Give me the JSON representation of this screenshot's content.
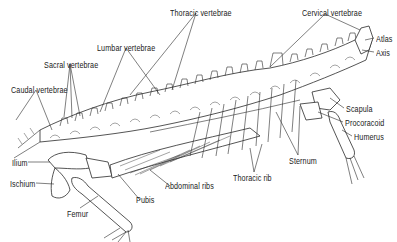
{
  "figure": {
    "labels": [
      {
        "id": "thoracic-vertebrae",
        "text": "Thoracic vertebrae",
        "x": 170,
        "y": 9
      },
      {
        "id": "cervical-vertebrae",
        "text": "Cervical vertebrae",
        "x": 302,
        "y": 9
      },
      {
        "id": "atlas",
        "text": "Atlas",
        "x": 376,
        "y": 35
      },
      {
        "id": "axis",
        "text": "Axis",
        "x": 376,
        "y": 49
      },
      {
        "id": "lumbar-vertebrae",
        "text": "Lumbar vertebrae",
        "x": 97,
        "y": 44
      },
      {
        "id": "sacral-vertebrae",
        "text": "Sacral vertebrae",
        "x": 44,
        "y": 61
      },
      {
        "id": "caudal-vertebrae",
        "text": "Caudal vertebrae",
        "x": 11,
        "y": 86
      },
      {
        "id": "scapula",
        "text": "Scapula",
        "x": 346,
        "y": 105
      },
      {
        "id": "procoracoid",
        "text": "Procoracoid",
        "x": 345,
        "y": 119
      },
      {
        "id": "humerus",
        "text": "Humerus",
        "x": 354,
        "y": 133
      },
      {
        "id": "sternum",
        "text": "Sternum",
        "x": 289,
        "y": 157
      },
      {
        "id": "ilium",
        "text": "Ilium",
        "x": 12,
        "y": 159
      },
      {
        "id": "ischium",
        "text": "Ischium",
        "x": 10,
        "y": 180
      },
      {
        "id": "thoracic-rib",
        "text": "Thoracic rib",
        "x": 233,
        "y": 174
      },
      {
        "id": "abdominal-ribs",
        "text": "Abdominal ribs",
        "x": 165,
        "y": 182
      },
      {
        "id": "pubis",
        "text": "Pubis",
        "x": 136,
        "y": 196
      },
      {
        "id": "femur",
        "text": "Femur",
        "x": 67,
        "y": 210
      }
    ]
  }
}
